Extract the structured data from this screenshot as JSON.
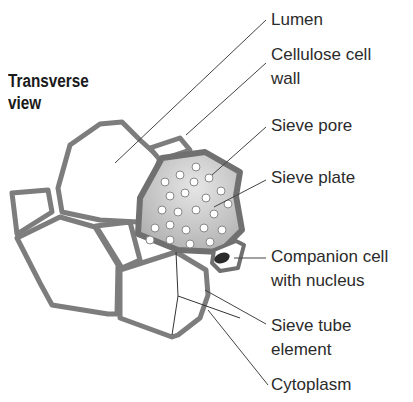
{
  "title": {
    "line1": "Transverse",
    "line2": "view"
  },
  "labels": {
    "lumen": "Lumen",
    "cell_wall_1": "Cellulose cell",
    "cell_wall_2": "wall",
    "sieve_pore": "Sieve pore",
    "sieve_plate": "Sieve plate",
    "companion_1": "Companion cell",
    "companion_2": "with nucleus",
    "sieve_tube_1": "Sieve tube",
    "sieve_tube_2": "element",
    "cytoplasm": "Cytoplasm"
  },
  "colors": {
    "wall": "#7a7a7a",
    "plate_fill": "#bdbdbd",
    "nucleus": "#2a2a2a",
    "leader": "#444444",
    "text": "#2b2b2b"
  }
}
